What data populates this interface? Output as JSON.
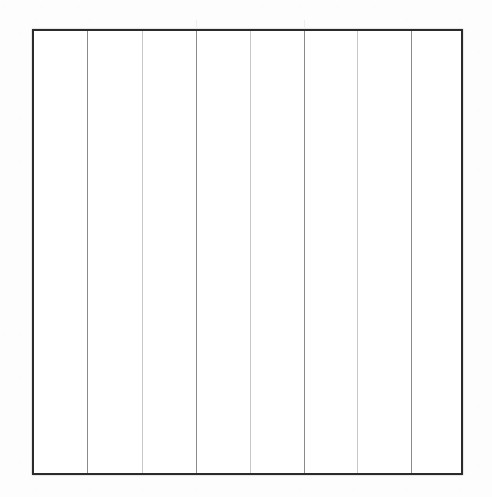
{
  "document": {
    "title": "Blank ruled column grid",
    "description": "Empty bordered rectangle subdivided into eight vertical columns by seven interior rules. No text, headers, or cell contents are present.",
    "canvas_width": 492,
    "canvas_height": 497,
    "background_color": "#fdfdfd"
  },
  "frame": {
    "name": "outer border rectangle",
    "left": 32,
    "top": 29,
    "right": 463,
    "bottom": 475,
    "width": 431,
    "height": 446,
    "stroke_color": "#2b2b2b",
    "stroke_width": 2,
    "fill_color": "#ffffff"
  },
  "grid": {
    "column_count": 8,
    "row_count": 1,
    "interior_rule_count": 7,
    "orientation": "vertical",
    "horizontal_rules": [],
    "rules": [
      {
        "index": 1,
        "x": 87,
        "weight": "dark",
        "color": "#8a8a8a",
        "width": 1
      },
      {
        "index": 2,
        "x": 142,
        "weight": "light",
        "color": "#c6c6c6",
        "width": 1
      },
      {
        "index": 3,
        "x": 196,
        "weight": "dark",
        "color": "#8a8a8a",
        "width": 1
      },
      {
        "index": 4,
        "x": 250,
        "weight": "light",
        "color": "#c6c6c6",
        "width": 1
      },
      {
        "index": 5,
        "x": 304,
        "weight": "dark",
        "color": "#8a8a8a",
        "width": 1
      },
      {
        "index": 6,
        "x": 357,
        "weight": "light",
        "color": "#c6c6c6",
        "width": 1
      },
      {
        "index": 7,
        "x": 411,
        "weight": "dark",
        "color": "#8a8a8a",
        "width": 1
      }
    ],
    "columns": [
      {
        "index": 1,
        "left": 32,
        "right": 87,
        "width": 55,
        "content": ""
      },
      {
        "index": 2,
        "left": 87,
        "right": 142,
        "width": 55,
        "content": ""
      },
      {
        "index": 3,
        "left": 142,
        "right": 196,
        "width": 54,
        "content": ""
      },
      {
        "index": 4,
        "left": 196,
        "right": 250,
        "width": 54,
        "content": ""
      },
      {
        "index": 5,
        "left": 250,
        "right": 304,
        "width": 54,
        "content": ""
      },
      {
        "index": 6,
        "left": 304,
        "right": 357,
        "width": 53,
        "content": ""
      },
      {
        "index": 7,
        "left": 357,
        "right": 411,
        "width": 54,
        "content": ""
      },
      {
        "index": 8,
        "left": 411,
        "right": 463,
        "width": 52,
        "content": ""
      }
    ],
    "ghost_marks": [
      {
        "x": 196,
        "y": 20,
        "color": "#ededed"
      },
      {
        "x": 304,
        "y": 20,
        "color": "#ededed"
      }
    ]
  }
}
